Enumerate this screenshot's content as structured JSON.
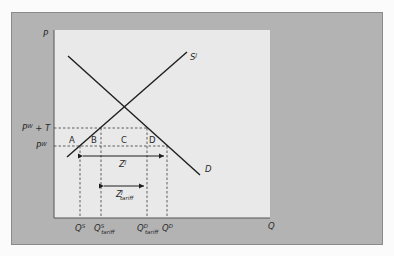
{
  "diagram": {
    "type": "supply-demand-tariff",
    "colors": {
      "page_background": "#fbfbfb",
      "panel_background": "#b3b3b3",
      "plot_background": "#e9e9e9",
      "line_color": "#1e1e1e",
      "dash_color": "#3a3a3a"
    },
    "axes": {
      "y_label": "P",
      "x_label": "Q"
    },
    "curves": {
      "supply": {
        "label": "S",
        "superscript": "J"
      },
      "demand": {
        "label": "D"
      }
    },
    "price_levels": {
      "world_plus_tariff": {
        "base": "P",
        "superscript": "W",
        "suffix": " + T"
      },
      "world": {
        "base": "P",
        "superscript": "W"
      }
    },
    "areas": {
      "a": "A",
      "b": "B",
      "c": "C",
      "d": "D"
    },
    "imports": {
      "free_trade": {
        "base": "Z",
        "superscript": "J"
      },
      "with_tariff": {
        "base": "Z",
        "superscript": "J",
        "subscript": "tariff"
      }
    },
    "quantities": {
      "qs": {
        "base": "Q",
        "superscript": "S"
      },
      "qs_tariff": {
        "base": "Q",
        "superscript": "S",
        "subscript": "tariff"
      },
      "qd_tariff": {
        "base": "Q",
        "superscript": "D",
        "subscript": "tariff"
      },
      "qd": {
        "base": "Q",
        "superscript": "D"
      }
    }
  }
}
